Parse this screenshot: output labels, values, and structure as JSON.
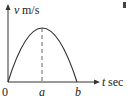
{
  "diagram": {
    "type": "velocity-time graph",
    "y_axis_label_var": "v",
    "y_axis_label_unit": "m/s",
    "x_axis_label_var": "t",
    "x_axis_label_unit": "sec",
    "origin_label": "0",
    "peak_label": "a",
    "end_label": "b",
    "curve": "parabola from (0,0) through peak at t=a, back to zero at t=b",
    "colors": {
      "line": "#333333",
      "dashed": "#666666"
    }
  }
}
